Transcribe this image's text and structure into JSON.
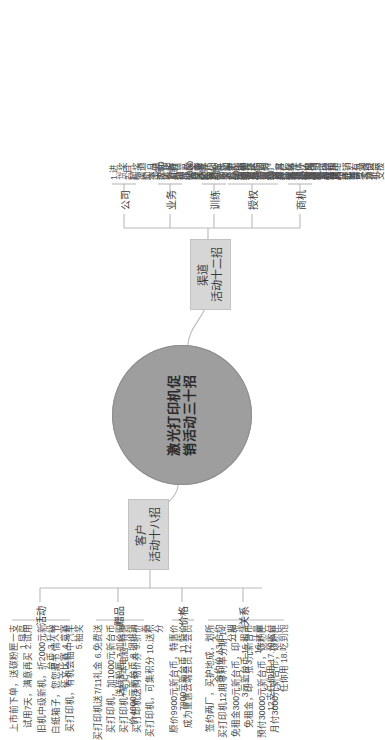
{
  "document": {
    "type": "mind-map",
    "orientation": "rotated-90",
    "central_topic": "激光打印机促销\n销活动三十招",
    "central_topic_line1": "激光打印机促",
    "central_topic_line2": "销活动三十招",
    "colors": {
      "central_fill": "#9e9e9e",
      "branch_fill": "#d6d6d6",
      "line": "#b9b9b9",
      "text": "#4a4a4a",
      "background": "#ffffff"
    }
  },
  "branches": [
    {
      "id": "customer",
      "label_line1": "客户",
      "label_line2": "活动十八招",
      "categories": [
        {
          "name": "活动",
          "items": [
            {
              "num": "1.早鸟",
              "text": "上市前下单，送碳粉匣一支"
            },
            {
              "num": "2.试用",
              "text": "试用7天，满意再买"
            },
            {
              "num": "3.升级",
              "text": "旧机中级新机，折2000元新台币"
            },
            {
              "num": "4.竞赛",
              "text": "白纸箱子，您您藏书\n情人节征文比赛"
            },
            {
              "num": "5.抽奖",
              "text": "买打印机，有机会抽中汽车"
            }
          ]
        },
        {
          "name": "赠品",
          "items": [
            {
              "num": "6.免费送",
              "text": "买打印机送7/11礼金"
            },
            {
              "num": "7.加价购",
              "text": "买打印机，加1000元新台币送碳粉匣"
            },
            {
              "num": "8.捆绑销",
              "text": "买打印机+笔记本电脑=特惠价4000元新台币"
            },
            {
              "num": "9.折价券",
              "text": "买打印机送购物价券"
            },
            {
              "num": "10.送积分",
              "text": "买打印机，可集积分"
            }
          ]
        },
        {
          "name": "价格",
          "items": [
            {
              "num": "11.特价",
              "text": "原价9900元新台币，特惠价7900元新台币"
            },
            {
              "num": "12.会员",
              "text": "成为重惠云端会员"
            }
          ]
        },
        {
          "name": "关系",
          "items": [
            {
              "num": "13.合约",
              "text": "签约两厂，买护地成，划所合约价"
            },
            {
              "num": "14.分期",
              "text": "买打印机12期零利率分期"
            },
            {
              "num": "15.租赁",
              "text": "免租金300元新台币，印一张3元新台币"
            },
            {
              "num": "16.计量",
              "text": "免租金，印一张3元新台币"
            },
            {
              "num": "17.预收付",
              "text": "预付30000元新台币，碳粉匣12支任你用"
            },
            {
              "num": "18.吃到饱",
              "text": "月付3000元新台币，碳粉匣任你用"
            }
          ]
        }
      ]
    },
    {
      "id": "channel",
      "label_line1": "渠道",
      "label_line2": "活动十二招",
      "categories": [
        {
          "name": "公司",
          "items": [
            {
              "num": "1.进货奖励",
              "text": "渠道本月进50台折扣5000元新台币"
            },
            {
              "num": "2.目标奖励",
              "text": "渠道达到月目标，再奖励2%"
            }
          ]
        },
        {
          "name": "业务",
          "items": [
            {
              "num": "3.销售奖金",
              "text": "业务奖金比，每台奖励500元新台币"
            },
            {
              "num": "4.销售竞赛",
              "text": "季竞赛，前十名老板旅游"
            }
          ]
        },
        {
          "name": "训练",
          "items": [
            {
              "num": "5.销售训练",
              "text": "后进店销售技巧训练，每月一次"
            },
            {
              "num": "6.服务训练",
              "text": "销售前后服务训练，每季一次"
            }
          ]
        },
        {
          "name": "授权",
          "items": [
            {
              "num": "7.销售授权",
              "text": "产业销售授权店"
            },
            {
              "num": "8.服务授权",
              "text": "售后服务特约认可"
            },
            {
              "num": "9.价格特惠",
              "text": "厂厂宣网，经销商可使用"
            },
            {
              "num": "10.来客安台子",
              "text": "来电机会，转给经销商"
            }
          ]
        },
        {
          "name": "商机",
          "items": [
            {
              "num": "11.媒体客来客",
              "text": "介绍产业，享有客端机会"
            },
            {
              "num": "12.项目支援",
              "text": "百年企业，享受项目支援"
            }
          ]
        }
      ]
    }
  ]
}
